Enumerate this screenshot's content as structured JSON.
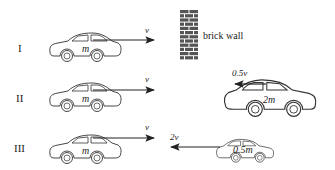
{
  "diagram": {
    "scenarios": [
      {
        "label": "I",
        "car": {
          "mass_label": "m",
          "direction": "right",
          "velocity_label": "v"
        },
        "obstacle": {
          "type": "brick-wall",
          "label": "brick wall"
        }
      },
      {
        "label": "II",
        "car": {
          "mass_label": "m",
          "direction": "right",
          "velocity_label": "v"
        },
        "obstacle": {
          "type": "car",
          "mass_label": "2m",
          "direction": "left",
          "velocity_label": "0.5v"
        }
      },
      {
        "label": "III",
        "car": {
          "mass_label": "m",
          "direction": "right",
          "velocity_label": "v"
        },
        "obstacle": {
          "type": "car",
          "mass_label": "0.5m",
          "direction": "left",
          "velocity_label": "2v"
        }
      }
    ]
  }
}
